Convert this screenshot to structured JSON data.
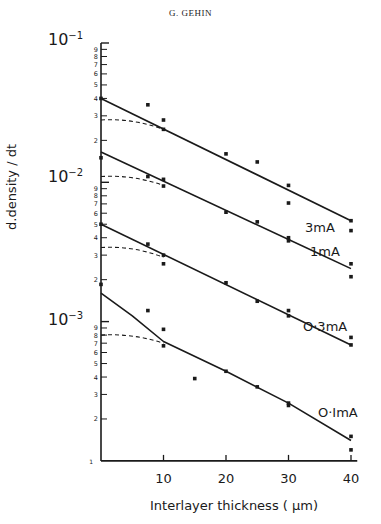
{
  "header": {
    "author": "G. GEHIN"
  },
  "chart_data": {
    "type": "scatter",
    "title": "",
    "xlabel": "Interlayer thickness (μm)",
    "ylabel": "d.density / dt",
    "xscale": "linear",
    "yscale": "log",
    "xlim": [
      0,
      41
    ],
    "ylim": [
      0.0001,
      0.1
    ],
    "x_ticks": [
      10,
      20,
      30,
      40
    ],
    "y_decade_labels": [
      "10⁻¹",
      "10⁻²",
      "10⁻³",
      "1"
    ],
    "y_minor_tick_labels": [
      "9",
      "8",
      "7",
      "6",
      "5",
      "4",
      "3",
      "2"
    ],
    "grid": false,
    "legend": "inline labels at right end of lines",
    "series": [
      {
        "name": "3mA",
        "points": [
          [
            0,
            0.04
          ],
          [
            7.5,
            0.036
          ],
          [
            10,
            0.028
          ],
          [
            10,
            0.024
          ],
          [
            20,
            0.016
          ],
          [
            25,
            0.014
          ],
          [
            30,
            0.0095
          ],
          [
            30,
            0.0071
          ],
          [
            40,
            0.0053
          ],
          [
            40,
            0.0045
          ]
        ],
        "fit_line": [
          [
            0,
            0.04
          ],
          [
            40,
            0.0053
          ]
        ],
        "dashed_curve": [
          [
            0,
            0.028
          ],
          [
            10,
            0.024
          ]
        ]
      },
      {
        "name": "1mA",
        "points": [
          [
            0,
            0.015
          ],
          [
            7.5,
            0.011
          ],
          [
            10,
            0.0105
          ],
          [
            10,
            0.0094
          ],
          [
            20,
            0.0061
          ],
          [
            25,
            0.0052
          ],
          [
            30,
            0.004
          ],
          [
            30,
            0.0038
          ],
          [
            40,
            0.0026
          ],
          [
            40,
            0.0021
          ]
        ],
        "fit_line": [
          [
            0,
            0.0165
          ],
          [
            40,
            0.0024
          ]
        ],
        "dashed_curve": [
          [
            0,
            0.011
          ],
          [
            10,
            0.0095
          ]
        ]
      },
      {
        "name": "0·3mA",
        "points": [
          [
            0,
            0.005
          ],
          [
            7.5,
            0.0036
          ],
          [
            10,
            0.003
          ],
          [
            10,
            0.0026
          ],
          [
            20,
            0.0019
          ],
          [
            25,
            0.0014
          ],
          [
            30,
            0.0012
          ],
          [
            30,
            0.0011
          ],
          [
            40,
            0.00077
          ],
          [
            40,
            0.00068
          ]
        ],
        "fit_line": [
          [
            0,
            0.005
          ],
          [
            40,
            0.00068
          ]
        ],
        "dashed_curve": [
          [
            0,
            0.0034
          ],
          [
            10,
            0.0029
          ]
        ]
      },
      {
        "name": "0·1mA",
        "points": [
          [
            0,
            0.00185
          ],
          [
            7.5,
            0.0012
          ],
          [
            10,
            0.00088
          ],
          [
            10,
            0.00067
          ],
          [
            15,
            0.00039
          ],
          [
            20,
            0.00044
          ],
          [
            25,
            0.00034
          ],
          [
            30,
            0.00026
          ],
          [
            30,
            0.00025
          ],
          [
            40,
            0.00015
          ],
          [
            40,
            0.00012
          ]
        ],
        "fit_curve": [
          [
            0,
            0.0016
          ],
          [
            5,
            0.0011
          ],
          [
            10,
            0.00072
          ],
          [
            20,
            0.00044
          ],
          [
            30,
            0.00026
          ],
          [
            40,
            0.00014
          ]
        ],
        "dashed_curve": [
          [
            0,
            0.0008
          ],
          [
            10,
            0.0007
          ]
        ]
      }
    ]
  },
  "labels": {
    "ylabel_text": "d.density",
    "ylabel_sub": "dt",
    "xlabel": "Interlayer thickness ( μm)",
    "decades": [
      {
        "base": "10",
        "exp": "−1"
      },
      {
        "base": "10",
        "exp": "−2"
      },
      {
        "base": "10",
        "exp": "−3"
      }
    ],
    "series_labels": [
      "3mA",
      "1mA",
      "O·3mA",
      "O·ImA"
    ],
    "x_ticks": [
      "10",
      "20",
      "30",
      "40"
    ],
    "origin": "1"
  }
}
